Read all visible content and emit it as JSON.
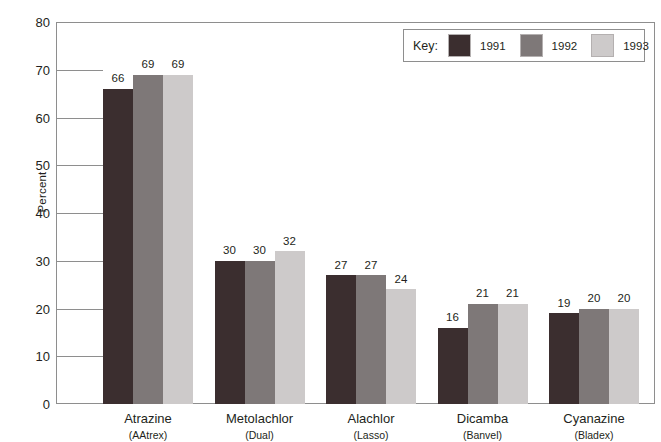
{
  "chart_data": {
    "type": "bar",
    "title": "",
    "subtitle": "",
    "xlabel": "",
    "ylabel": "Percent",
    "ylim": [
      0,
      80
    ],
    "ytick_step": 10,
    "ytick_labels": [
      "80",
      "70",
      "60",
      "50",
      "40",
      "30",
      "20",
      "10",
      "0"
    ],
    "grid": false,
    "legend_position": "top-right",
    "legend_title": "Key:",
    "categories": [
      "Atrazine",
      "Metolachlor",
      "Alachlor",
      "Dicamba",
      "Cyanazine"
    ],
    "category_alt_names": [
      "(AAtrex)",
      "(Dual)",
      "(Lasso)",
      "(Banvel)",
      "(Bladex)"
    ],
    "series": [
      {
        "name": "1991",
        "color": "#3b2e2f",
        "values": [
          66,
          30,
          27,
          16,
          19
        ]
      },
      {
        "name": "1992",
        "color": "#7e7878",
        "values": [
          69,
          30,
          27,
          21,
          20
        ]
      },
      {
        "name": "1993",
        "color": "#cdcaca",
        "values": [
          69,
          32,
          24,
          21,
          20
        ]
      }
    ]
  },
  "axis": {
    "y_title": "Percent"
  },
  "legend": {
    "title": "Key:",
    "entries": [
      {
        "label": "1991",
        "color": "#3b2e2f"
      },
      {
        "label": "1992",
        "color": "#7e7878"
      },
      {
        "label": "1993",
        "color": "#cdcaca"
      }
    ]
  }
}
